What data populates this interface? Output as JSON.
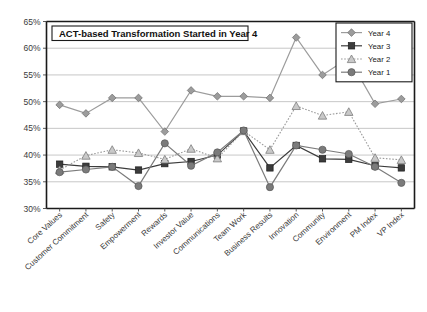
{
  "chart_data": {
    "type": "line",
    "title": "ACT-based Transformation Started in Year 4",
    "xlabel": "",
    "ylabel": "",
    "ylim": [
      30,
      65
    ],
    "ytick_labels": [
      "30%",
      "35%",
      "40%",
      "45%",
      "50%",
      "55%",
      "60%",
      "65%"
    ],
    "ytick_values": [
      30,
      35,
      40,
      45,
      50,
      55,
      60,
      65
    ],
    "grid": true,
    "legend_position": "top-right",
    "categories": [
      "Core Values",
      "Customer Commitment",
      "Safety",
      "Empowerment",
      "Rewards",
      "Investor Value",
      "Communications",
      "Team Work",
      "Business Results",
      "Innovation",
      "Community",
      "Environment",
      "PM Index",
      "VP Index"
    ],
    "series": [
      {
        "name": "Year 4",
        "marker": "diamond",
        "color": "#9c9c9c",
        "line_style": "solid",
        "values": [
          49.4,
          47.8,
          50.7,
          50.7,
          44.4,
          52.1,
          51.0,
          51.0,
          50.7,
          62.0,
          55.0,
          58.2,
          49.6,
          50.5
        ]
      },
      {
        "name": "Year 3",
        "marker": "square",
        "color": "#3c3c3c",
        "line_style": "solid",
        "values": [
          38.3,
          37.9,
          37.8,
          37.2,
          38.4,
          38.8,
          40.0,
          44.5,
          37.6,
          41.8,
          39.3,
          39.2,
          38.0,
          37.6
        ]
      },
      {
        "name": "Year 2",
        "marker": "triangle",
        "color": "#a8a8a8",
        "line_style": "dotted",
        "values": [
          37.2,
          39.9,
          41.0,
          40.4,
          39.2,
          41.2,
          39.4,
          44.5,
          41.0,
          49.2,
          47.4,
          48.1,
          39.5,
          39.1
        ]
      },
      {
        "name": "Year 1",
        "marker": "circle",
        "color": "#7b7b7b",
        "line_style": "solid",
        "values": [
          36.8,
          37.3,
          37.8,
          34.2,
          42.2,
          38.0,
          40.5,
          44.6,
          34.0,
          41.8,
          41.0,
          40.2,
          37.8,
          34.8
        ]
      }
    ]
  },
  "legend": {
    "entries": [
      "Year 4",
      "Year 3",
      "Year 2",
      "Year 1"
    ]
  }
}
